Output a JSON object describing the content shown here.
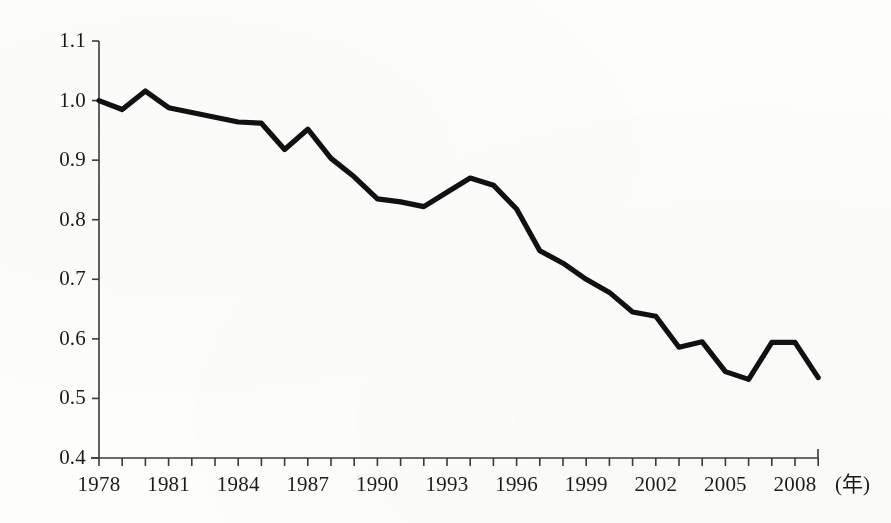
{
  "chart_data": {
    "type": "line",
    "title": "",
    "subtitle": "",
    "xlabel": "(年)",
    "ylabel": "",
    "xlim": [
      1977.5,
      2009.6
    ],
    "ylim": [
      0.4,
      1.1
    ],
    "grid": false,
    "legend": null,
    "legend_position": "none",
    "line_color": "#111111",
    "background_color": "#fdfdfb",
    "axis_color": "#3a3a3a",
    "y_ticks": [
      "1.1",
      "1.0",
      "0.9",
      "0.8",
      "0.7",
      "0.6",
      "0.5",
      "0.4"
    ],
    "y_tick_values": [
      1.1,
      1.0,
      0.9,
      0.8,
      0.7,
      0.6,
      0.5,
      0.4
    ],
    "x_tick_values": [
      1978,
      1979,
      1980,
      1981,
      1982,
      1983,
      1984,
      1985,
      1986,
      1987,
      1988,
      1989,
      1990,
      1991,
      1992,
      1993,
      1994,
      1995,
      1996,
      1997,
      1998,
      1999,
      2000,
      2001,
      2002,
      2003,
      2004,
      2005,
      2006,
      2007,
      2008,
      2009
    ],
    "x_tick_labels": [
      "1978",
      "1981",
      "1984",
      "1987",
      "1990",
      "1993",
      "1996",
      "1999",
      "2002",
      "2005",
      "2008"
    ],
    "x_tick_label_values": [
      1978,
      1981,
      1984,
      1987,
      1990,
      1993,
      1996,
      1999,
      2002,
      2005,
      2008
    ],
    "x": [
      1978,
      1979,
      1980,
      1981,
      1982,
      1983,
      1984,
      1985,
      1986,
      1987,
      1988,
      1989,
      1990,
      1991,
      1992,
      1993,
      1994,
      1995,
      1996,
      1997,
      1998,
      1999,
      2000,
      2001,
      2002,
      2003,
      2004,
      2005,
      2006,
      2007,
      2008,
      2009
    ],
    "values": [
      1.0,
      0.985,
      1.016,
      0.988,
      0.98,
      0.972,
      0.964,
      0.962,
      0.918,
      0.952,
      0.903,
      0.872,
      0.835,
      0.83,
      0.822,
      0.846,
      0.87,
      0.858,
      0.818,
      0.748,
      0.727,
      0.7,
      0.678,
      0.645,
      0.638,
      0.586,
      0.595,
      0.545,
      0.532,
      0.594,
      0.594,
      0.535
    ],
    "series": [
      {
        "name": "",
        "values": [
          1.0,
          0.985,
          1.016,
          0.988,
          0.98,
          0.972,
          0.964,
          0.962,
          0.918,
          0.952,
          0.903,
          0.872,
          0.835,
          0.83,
          0.822,
          0.846,
          0.87,
          0.858,
          0.818,
          0.748,
          0.727,
          0.7,
          0.678,
          0.645,
          0.638,
          0.586,
          0.595,
          0.545,
          0.532,
          0.594,
          0.594,
          0.535
        ]
      }
    ],
    "annotations": []
  }
}
